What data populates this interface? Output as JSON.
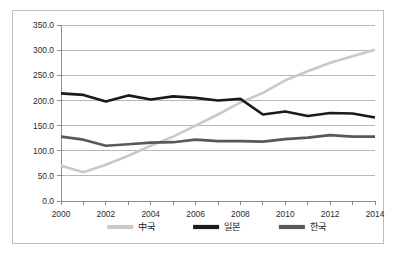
{
  "chart_data": {
    "type": "line",
    "title": "",
    "subtitle": "",
    "xlabel": "",
    "ylabel": "",
    "x": [
      2000,
      2001,
      2002,
      2003,
      2004,
      2005,
      2006,
      2007,
      2008,
      2009,
      2010,
      2011,
      2012,
      2013,
      2014
    ],
    "xlim": [
      2000,
      2014
    ],
    "ylim": [
      0,
      350
    ],
    "ytick_values": [
      0,
      50,
      100,
      150,
      200,
      250,
      300,
      350
    ],
    "ytick_labels": [
      "0.0",
      "50.0",
      "100.0",
      "150.0",
      "200.0",
      "250.0",
      "300.0",
      "350.0"
    ],
    "xtick_values": [
      2000,
      2002,
      2004,
      2006,
      2008,
      2010,
      2012,
      2014
    ],
    "xtick_labels": [
      "2000",
      "2002",
      "2004",
      "2006",
      "2008",
      "2010",
      "2012",
      "2014"
    ],
    "grid": true,
    "grid_axis": "y",
    "legend_position": "bottom",
    "series": [
      {
        "name": "中국",
        "color": "#c9c9c9",
        "width": 2.6,
        "values": [
          70,
          57,
          72,
          90,
          110,
          128,
          150,
          172,
          196,
          215,
          240,
          258,
          275,
          288,
          301
        ]
      },
      {
        "name": "일본",
        "color": "#1a1a1a",
        "width": 2.6,
        "values": [
          214,
          211,
          198,
          210,
          202,
          208,
          205,
          200,
          203,
          172,
          178,
          169,
          175,
          174,
          166
        ]
      },
      {
        "name": "한국",
        "color": "#595959",
        "width": 2.6,
        "values": [
          128,
          122,
          110,
          113,
          116,
          117,
          122,
          119,
          119,
          118,
          123,
          126,
          131,
          128,
          128
        ]
      }
    ]
  },
  "legend": {
    "items": [
      {
        "label": "中국",
        "color": "#c9c9c9"
      },
      {
        "label": "일본",
        "color": "#1a1a1a"
      },
      {
        "label": "한국",
        "color": "#595959"
      }
    ]
  },
  "colors": {
    "frame_border": "#bdbdbd",
    "gridline": "#a6a6a6",
    "axis": "#808080",
    "text": "#2b2b2b",
    "background": "#ffffff"
  }
}
